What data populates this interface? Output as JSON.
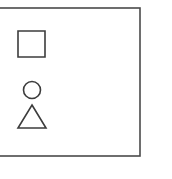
{
  "diagram": {
    "background_color": "#ffffff",
    "stroke_color": "#3c3c3c",
    "frame_stroke_color": "#4a4a4a",
    "canvas": {
      "width": 172,
      "height": 179
    },
    "frame": {
      "name": "outer-frame-rectangle",
      "x": -14,
      "y": 8,
      "width": 154,
      "height": 148,
      "clipped_left_edge": true
    },
    "shapes": [
      {
        "id": "square",
        "label": "Square",
        "type": "square",
        "x": 18,
        "y": 31,
        "width": 27,
        "height": 26,
        "fill": "none"
      },
      {
        "id": "circle",
        "label": "Circle",
        "type": "circle",
        "cx": 32,
        "cy": 90,
        "r": 8.5,
        "fill": "none"
      },
      {
        "id": "triangle",
        "label": "Triangle",
        "type": "triangle",
        "apex_x": 32,
        "apex_y": 105,
        "base_left_x": 18,
        "base_right_x": 46,
        "base_y": 128,
        "fill": "none"
      }
    ]
  }
}
